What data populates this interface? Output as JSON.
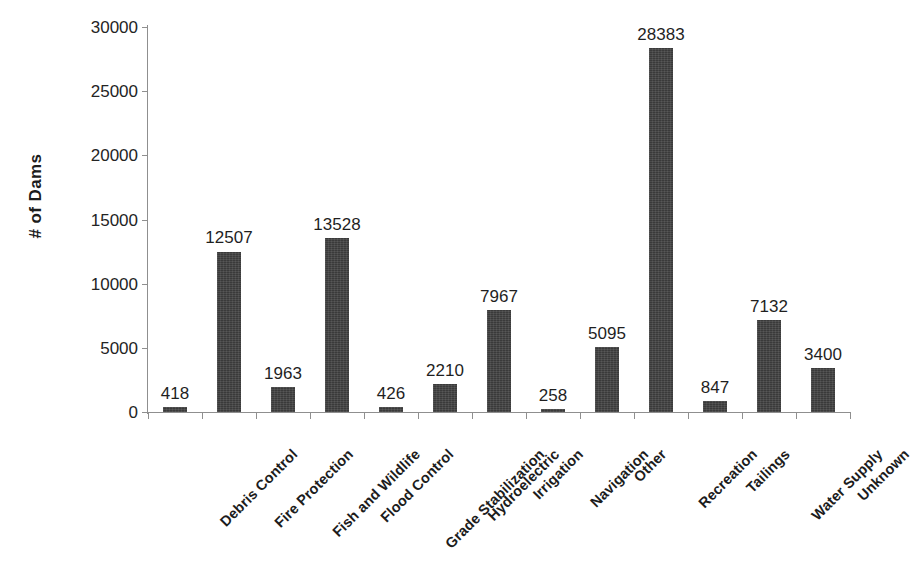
{
  "chart_data": {
    "type": "bar",
    "title": "",
    "xlabel": "",
    "ylabel": "# of Dams",
    "ylim": [
      0,
      30000
    ],
    "ytick_values": [
      0,
      5000,
      10000,
      15000,
      20000,
      25000,
      30000
    ],
    "ytick_labels": [
      "0",
      "5000",
      "10000",
      "15000",
      "20000",
      "25000",
      "30000"
    ],
    "grid": false,
    "legend": false,
    "legend_position": "none",
    "bar_color": "#3a3a3a",
    "value_labels_shown": true,
    "xtick_label_rotation": -45,
    "categories": [
      "Debris Control",
      "Fire Protection",
      "Fish and Wildlife",
      "Flood Control",
      "Grade Stabilization",
      "Hydroelectric",
      "Irrigation",
      "Navigation",
      "Other",
      "Recreation",
      "Tailings",
      "Water Supply",
      "Unknown"
    ],
    "values": [
      418,
      12507,
      1963,
      13528,
      426,
      2210,
      7967,
      258,
      5095,
      28383,
      847,
      7132,
      3400
    ],
    "value_label_texts": [
      "418",
      "12507",
      "1963",
      "13528",
      "426",
      "2210",
      "7967",
      "258",
      "5095",
      "28383",
      "847",
      "7132",
      "3400"
    ]
  }
}
